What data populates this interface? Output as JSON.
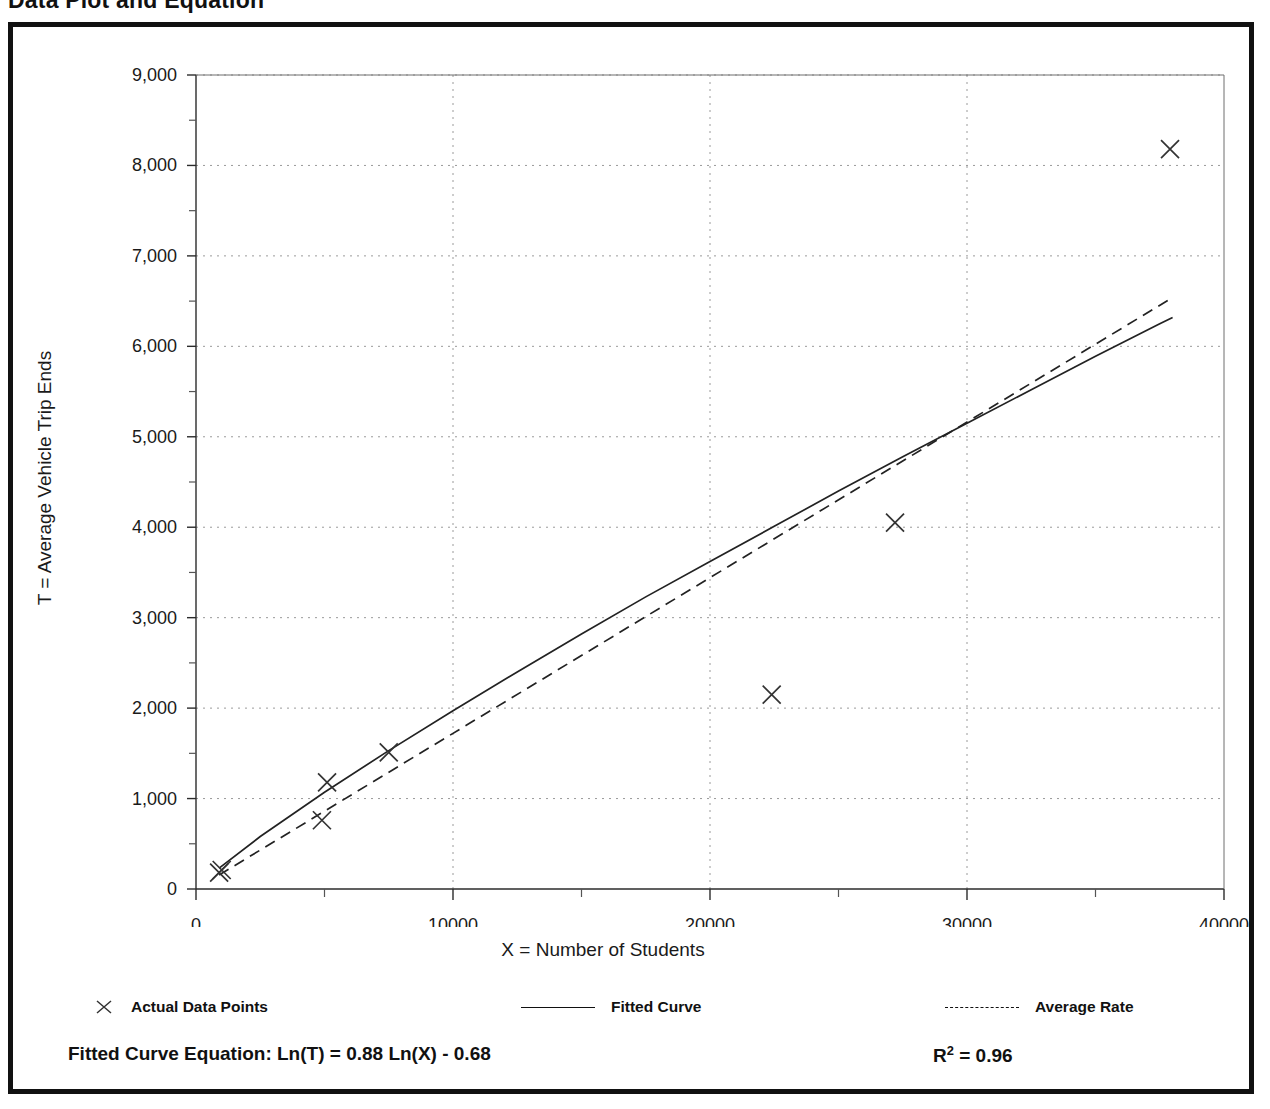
{
  "page": {
    "title": "Data Plot and Equation"
  },
  "chart_data": {
    "type": "scatter",
    "title": "Data Plot and Equation",
    "xlabel": "X = Number of Students",
    "ylabel": "T = Average Vehicle Trip Ends",
    "xlim": [
      0,
      40000
    ],
    "ylim": [
      0,
      9000
    ],
    "x_ticks": [
      0,
      10000,
      20000,
      30000,
      40000
    ],
    "x_tick_labels": [
      "0",
      "10000",
      "20000",
      "30000",
      "40000"
    ],
    "x_minor_tick_step": 5000,
    "y_ticks": [
      0,
      1000,
      2000,
      3000,
      4000,
      5000,
      6000,
      7000,
      8000,
      9000
    ],
    "y_tick_labels": [
      "0",
      "1,000",
      "2,000",
      "3,000",
      "4,000",
      "5,000",
      "6,000",
      "7,000",
      "8,000",
      "9,000"
    ],
    "y_minor_tick_step": 500,
    "grid": "major dotted both axes",
    "legend_position": "below plot",
    "series": [
      {
        "name": "Actual Data Points",
        "type": "scatter",
        "marker": "x",
        "points": [
          [
            900,
            180
          ],
          [
            1000,
            210
          ],
          [
            4900,
            760
          ],
          [
            5100,
            1180
          ],
          [
            7500,
            1510
          ],
          [
            22400,
            2150
          ],
          [
            27200,
            4050
          ],
          [
            37900,
            8180
          ]
        ]
      },
      {
        "name": "Fitted Curve",
        "type": "line",
        "style": "solid",
        "equation": "Ln(T) = 0.88 Ln(X) - 0.68",
        "points": [
          [
            900,
            230
          ],
          [
            2500,
            580
          ],
          [
            5000,
            1070
          ],
          [
            7500,
            1530
          ],
          [
            10000,
            1970
          ],
          [
            12500,
            2400
          ],
          [
            15000,
            2820
          ],
          [
            17500,
            3230
          ],
          [
            20000,
            3620
          ],
          [
            22500,
            4010
          ],
          [
            25000,
            4400
          ],
          [
            27500,
            4780
          ],
          [
            30000,
            5150
          ],
          [
            32500,
            5520
          ],
          [
            35000,
            5890
          ],
          [
            37500,
            6250
          ],
          [
            38000,
            6320
          ]
        ]
      },
      {
        "name": "Average Rate",
        "type": "line",
        "style": "dashed",
        "points": [
          [
            900,
            155
          ],
          [
            38000,
            6540
          ]
        ]
      }
    ]
  },
  "legend": {
    "items": [
      {
        "label": "Actual Data Points",
        "marker": "x-marker"
      },
      {
        "label": "Fitted Curve",
        "marker": "solid-line"
      },
      {
        "label": "Average Rate",
        "marker": "dashed-line"
      }
    ]
  },
  "footer": {
    "equation": "Fitted Curve Equation:  Ln(T) = 0.88 Ln(X) - 0.68",
    "r_squared_label": "R",
    "r_squared_exponent": "2",
    "r_squared_value": " = 0.96"
  },
  "colors": {
    "ink": "#111111",
    "grid": "#888888",
    "background": "#ffffff"
  }
}
